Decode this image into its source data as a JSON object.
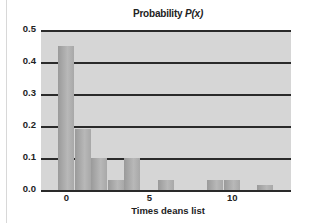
{
  "chart_data": {
    "type": "bar",
    "title": "Probability P(x)",
    "title_prefix": "Probability ",
    "title_var": "P(x)",
    "xlabel": "Times deans list",
    "ylabel": "",
    "ylim": [
      0,
      0.5
    ],
    "yticks": [
      "0.0",
      "0.1",
      "0.2",
      "0.3",
      "0.4",
      "0.5"
    ],
    "xticks": [
      "0",
      "5",
      "10"
    ],
    "grid": true,
    "categories": [
      0,
      1,
      2,
      3,
      4,
      5,
      6,
      7,
      8,
      9,
      10,
      11,
      12
    ],
    "values": [
      0.45,
      0.19,
      0.1,
      0.03,
      0.1,
      0.0,
      0.03,
      0.0,
      0.0,
      0.03,
      0.03,
      0.0,
      0.015
    ],
    "colors": {
      "bar": "#a8a8a8",
      "plot_bg": "#d6d6d6",
      "grid": "#2a2a2a"
    }
  }
}
